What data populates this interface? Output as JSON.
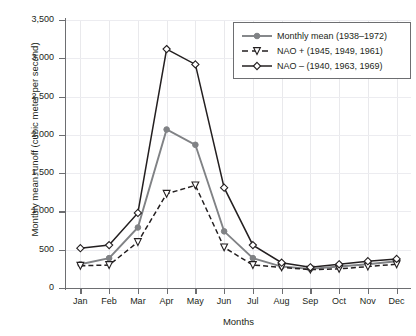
{
  "chart_data": {
    "type": "line",
    "title": "",
    "xlabel": "Months",
    "ylabel": "Monthly mean runoff (cubic meter per second)",
    "categories": [
      "Jan",
      "Feb",
      "Mar",
      "Apr",
      "May",
      "Jun",
      "Jul",
      "Aug",
      "Sep",
      "Oct",
      "Nov",
      "Dec"
    ],
    "ylim": [
      0,
      3500
    ],
    "yticks": [
      "0",
      "500",
      "1,000",
      "1,500",
      "2,000",
      "2,500",
      "3,000",
      "3,500"
    ],
    "ytick_values": [
      0,
      500,
      1000,
      1500,
      2000,
      2500,
      3000,
      3500
    ],
    "grid": "both",
    "legend_position": "top-right",
    "series": [
      {
        "name": "Monthly mean (1938–1972)",
        "marker": "filled-circle",
        "line": "solid",
        "color": "#808285",
        "values": [
          310,
          390,
          790,
          2070,
          1870,
          740,
          390,
          280,
          250,
          280,
          310,
          350
        ]
      },
      {
        "name": "NAO + (1945, 1949, 1961)",
        "marker": "open-triangle-down",
        "line": "dashed",
        "color": "#231f20",
        "values": [
          290,
          300,
          600,
          1230,
          1340,
          530,
          300,
          270,
          240,
          250,
          280,
          310
        ]
      },
      {
        "name": "NAO – (1940, 1963, 1969)",
        "marker": "open-diamond",
        "line": "solid",
        "color": "#231f20",
        "values": [
          520,
          560,
          980,
          3120,
          2920,
          1310,
          560,
          330,
          270,
          310,
          350,
          380
        ]
      }
    ]
  },
  "colors": {
    "axis": "#6d6e71",
    "grid": "#e9e9ec",
    "text": "#231f20",
    "gray_series": "#808285",
    "black_series": "#231f20",
    "background": "#ffffff"
  }
}
